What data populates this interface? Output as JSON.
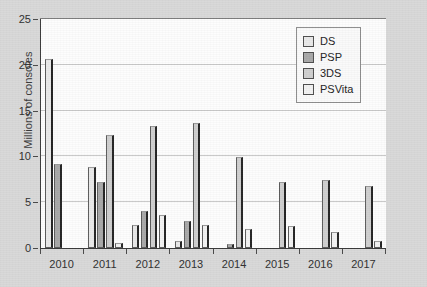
{
  "chart_data": {
    "type": "bar",
    "title": "",
    "xlabel": "",
    "ylabel": "Millions of consoles",
    "categories": [
      "2010",
      "2011",
      "2012",
      "2013",
      "2014",
      "2015",
      "2016",
      "2017"
    ],
    "ylim": [
      0,
      25
    ],
    "yticks": [
      0,
      5,
      10,
      15,
      20,
      25
    ],
    "ytick_labels": [
      "0",
      "5",
      "10",
      "15",
      "20",
      "25"
    ],
    "grid": "horizontal",
    "legend_position": "top-right",
    "series": [
      {
        "name": "DS",
        "color": "#e9e9e9",
        "values": [
          20.6,
          8.8,
          2.5,
          0.8,
          0.0,
          0.0,
          0.0,
          0.0
        ]
      },
      {
        "name": "PSP",
        "color": "#a8a8a8",
        "values": [
          9.2,
          7.2,
          4.0,
          2.9,
          0.4,
          0.0,
          0.0,
          0.0
        ]
      },
      {
        "name": "3DS",
        "color": "#cfcfcf",
        "values": [
          0.0,
          12.3,
          13.3,
          13.7,
          9.9,
          7.2,
          7.4,
          6.8
        ]
      },
      {
        "name": "PSVita",
        "color": "#f2f2f2",
        "values": [
          0.0,
          0.5,
          3.6,
          2.5,
          2.1,
          2.4,
          1.8,
          0.8
        ]
      }
    ]
  },
  "axis": {
    "y_title": "Millions of consoles"
  },
  "legend": {
    "entries": [
      {
        "label": "DS"
      },
      {
        "label": "PSP"
      },
      {
        "label": "3DS"
      },
      {
        "label": "PSVita"
      }
    ]
  }
}
